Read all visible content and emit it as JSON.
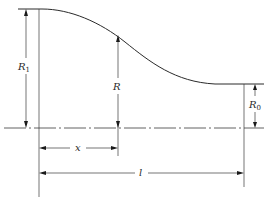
{
  "diagram": {
    "title": "",
    "labels": {
      "R1": {
        "main": "R",
        "sub": "1"
      },
      "R": {
        "main": "R"
      },
      "R0": {
        "main": "R",
        "sub": "0"
      },
      "x": {
        "main": "x"
      },
      "l": {
        "main": "l"
      }
    },
    "colors": {
      "line": "#2a2a2a",
      "background": "#ffffff"
    }
  }
}
